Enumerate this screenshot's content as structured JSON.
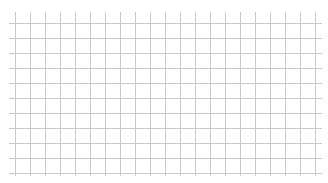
{
  "canvas": {
    "width": 328,
    "height": 183,
    "background": "#ffffff"
  },
  "grid": {
    "line_color": "#c9c9c9",
    "line_width": 1,
    "vertical_lines": {
      "count": 21,
      "start_x": 15,
      "spacing": 15,
      "y_from": 12,
      "y_to": 176
    },
    "horizontal_lines": {
      "count": 11,
      "start_y": 22.5,
      "spacing": 15,
      "x_from": 9,
      "x_to": 322
    }
  }
}
